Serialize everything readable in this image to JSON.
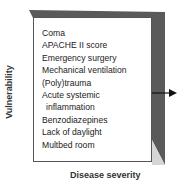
{
  "diagram": {
    "y_axis_label": "Vulnerability",
    "x_axis_label": "Disease severity",
    "risk_factors": [
      {
        "label": "Coma"
      },
      {
        "label": "APACHE II score"
      },
      {
        "label": "Emergency surgery"
      },
      {
        "label": "Mechanical ventilation"
      },
      {
        "label": "(Poly)trauma"
      },
      {
        "label": "Acute systemic"
      },
      {
        "label": "inflammation"
      },
      {
        "label": "Benzodiazepines"
      },
      {
        "label": "Lack of daylight"
      },
      {
        "label": "Multbed room"
      }
    ],
    "colors": {
      "dark": "#5a5a5a",
      "light": "#d6d6d6"
    }
  }
}
